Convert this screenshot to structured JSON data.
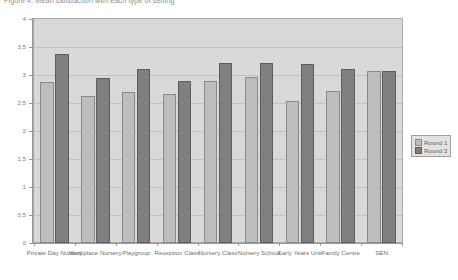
{
  "chart_data": {
    "type": "bar",
    "title": "Figure 4: Mean satisfaction with each type of setting",
    "xlabel": "",
    "ylabel": "",
    "ylim": [
      0,
      4
    ],
    "yticks": [
      "0",
      "0.5",
      "1",
      "1.5",
      "2",
      "2.5",
      "3",
      "3.5",
      "4"
    ],
    "grid": true,
    "legend_position": "right",
    "categories": [
      "Private Day Nursery",
      "Workplace Nursery",
      "Playgroup",
      "Reception Class",
      "Nursery Class",
      "Nursery School",
      "Early Years Unit",
      "Family Centre",
      "SEN"
    ],
    "series": [
      {
        "name": "Round 1",
        "color": "#bdbdbd",
        "values": [
          2.87,
          2.63,
          2.7,
          2.66,
          2.89,
          2.96,
          2.53,
          2.72,
          3.07
        ]
      },
      {
        "name": "Round 2",
        "color": "#808080",
        "values": [
          3.38,
          2.94,
          3.1,
          2.9,
          3.22,
          3.21,
          3.2,
          3.1,
          3.08
        ]
      }
    ]
  },
  "legend": {
    "items": [
      {
        "label": "Round 1"
      },
      {
        "label": "Round 2"
      }
    ]
  }
}
